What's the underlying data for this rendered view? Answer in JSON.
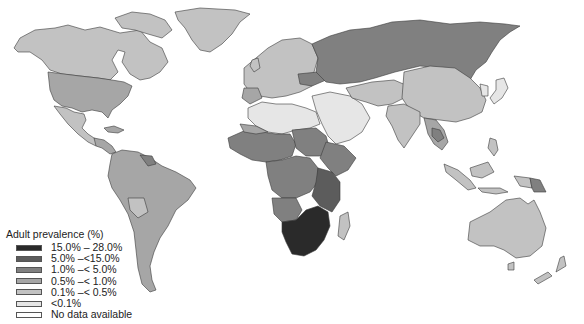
{
  "map": {
    "type": "choropleth-world",
    "title": "Adult HIV prevalence by country",
    "legend": {
      "title": "Adult prevalence (%)",
      "items": [
        {
          "label": "15.0% –  28.0%",
          "color": "#2a2a2a"
        },
        {
          "label": "5.0% –<15.0%",
          "color": "#5c5c5c"
        },
        {
          "label": "1.0% –< 5.0%",
          "color": "#808080"
        },
        {
          "label": "0.5% –< 1.0%",
          "color": "#a6a6a6"
        },
        {
          "label": "0.1% –< 0.5%",
          "color": "#c2c2c2"
        },
        {
          "label": "<0.1%",
          "color": "#e6e6e6"
        },
        {
          "label": "No data available",
          "color": "#ffffff"
        }
      ]
    },
    "regions": {
      "north_america": "0.1% –< 0.5%",
      "usa": "0.5% –< 1.0%",
      "greenland": "0.1% –< 0.5%",
      "central_america": "0.5% –< 1.0%",
      "south_america": "0.5% –< 1.0%",
      "europe": "0.1% –< 0.5%",
      "russia": "1.0% –< 5.0%",
      "north_africa_middle_east": "<0.1%",
      "west_central_africa": "1.0% –< 5.0%",
      "east_africa": "5.0% –<15.0%",
      "southern_africa": "15.0% –  28.0%",
      "asia": "0.1% –< 0.5%",
      "southeast_asia": "0.5% –< 1.0%",
      "australia": "0.1% –< 0.5%",
      "papua_new_guinea": "1.0% –< 5.0%"
    }
  }
}
